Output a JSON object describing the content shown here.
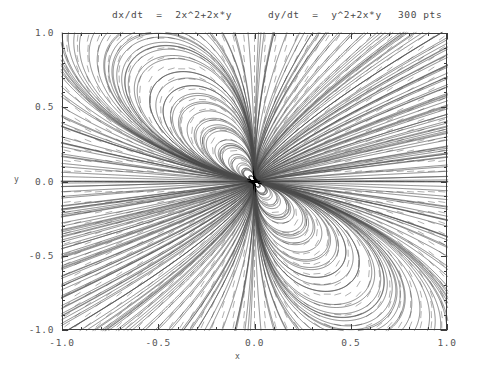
{
  "figure": {
    "width": 482,
    "height": 369,
    "background": "#ffffff"
  },
  "header": {
    "equation_x": "dx/dt  =  2x^2+2x*y",
    "equation_y": "dy/dt  =  y^2+2x*y",
    "points_label": "300 pts"
  },
  "axes": {
    "x_title": "x",
    "y_title": "y",
    "x_tick_labels": [
      "-1.0",
      "-0.5",
      "0.0",
      "0.5",
      "1.0"
    ],
    "y_tick_labels": [
      "1.0",
      "0.5",
      "0.0",
      "-0.5",
      "-1.0"
    ],
    "frame_color": "#3c3c3c",
    "plot_left": 62,
    "plot_top": 33,
    "plot_right": 447,
    "plot_bottom": 330
  },
  "chart_data": {
    "type": "scatter",
    "title": "dx/dt  =  2x^2+2x*y     dy/dt  =  y^2+2x*y     300 pts",
    "subtitle": "",
    "xlabel": "x",
    "ylabel": "y",
    "xlim": [
      -1.0,
      1.0
    ],
    "ylim": [
      -1.0,
      1.0
    ],
    "x_ticks": [
      -1.0,
      -0.5,
      0.0,
      0.5,
      1.0
    ],
    "y_ticks": [
      -1.0,
      -0.5,
      0.0,
      0.5,
      1.0
    ],
    "x_minor_ticks_per_interval": 5,
    "y_minor_ticks_per_interval": 5,
    "grid": false,
    "legend": "none",
    "plot_kind": "phase-portrait",
    "system": {
      "dx_dt": "2*x^2 + 2*x*y",
      "dy_dt": "y^2 + 2*x*y",
      "fixed_points": [
        [
          0.0,
          0.0
        ]
      ],
      "fixed_point_type": "degenerate-nilpotent-origin"
    },
    "direction_field": {
      "enabled": true,
      "marker": "dash",
      "color": "#9a9a9a",
      "grid_nx": 37,
      "grid_ny": 29,
      "dash_length_px": 7.0
    },
    "streamlines": {
      "enabled": true,
      "count": 300,
      "color": "#4a4a4a",
      "line_width": 0.65,
      "integration": "rk4",
      "step": 0.004,
      "max_steps": 2600,
      "seed_rings": [
        0.04,
        0.1,
        0.18,
        0.28,
        0.42,
        0.6,
        0.8,
        1.02,
        1.3
      ],
      "seed_border_count": 120,
      "description": "Trajectories radiate from and loop around the degenerate fixed point at the origin, forming nested teardrop loops in each quadrant plus near-radial rays toward the frame corners."
    }
  }
}
